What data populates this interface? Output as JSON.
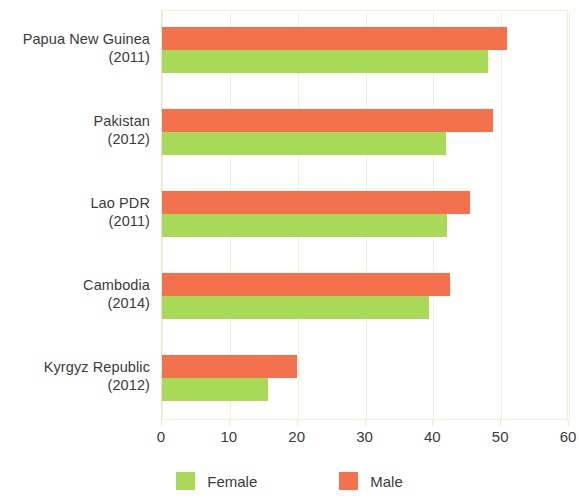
{
  "chart_data": {
    "type": "bar",
    "orientation": "horizontal",
    "title": "",
    "subtitle": "",
    "xlabel": "",
    "ylabel": "",
    "xlim": [
      0,
      60
    ],
    "xticks": [
      0,
      10,
      20,
      30,
      40,
      50,
      60
    ],
    "xtick_labels": [
      "0",
      "10",
      "20",
      "30",
      "40",
      "50",
      "60"
    ],
    "grid": true,
    "grid_axis": "x",
    "legend_position": "bottom",
    "categories": [
      "Papua New Guinea\n(2011)",
      "Pakistan\n(2012)",
      "Lao PDR\n(2011)",
      "Cambodia\n(2014)",
      "Kyrgyz Republic\n(2012)"
    ],
    "category_rows": [
      {
        "name": "Papua New Guinea",
        "year": "(2011)",
        "female": 48.0,
        "male": 50.8
      },
      {
        "name": "Pakistan",
        "year": "(2012)",
        "female": 41.8,
        "male": 48.8
      },
      {
        "name": "Lao PDR",
        "year": "(2011)",
        "female": 42.0,
        "male": 45.4
      },
      {
        "name": "Cambodia",
        "year": "(2014)",
        "female": 39.4,
        "male": 42.4
      },
      {
        "name": "Kyrgyz Republic",
        "year": "(2012)",
        "female": 15.6,
        "male": 19.9
      }
    ],
    "series": [
      {
        "name": "Female",
        "color": "#a8da58",
        "values": [
          48.0,
          41.8,
          42.0,
          39.4,
          15.6
        ]
      },
      {
        "name": "Male",
        "color": "#f4714e",
        "values": [
          50.8,
          48.8,
          45.4,
          42.4,
          19.9
        ]
      }
    ]
  },
  "legend": {
    "items": [
      {
        "label": "Female",
        "color": "#a8da58"
      },
      {
        "label": "Male",
        "color": "#f4714e"
      }
    ]
  },
  "colors": {
    "female": "#a8da58",
    "male": "#f4714e",
    "grid": "#f3f1d9",
    "text": "#3b3b3b",
    "background": "#ffffff"
  }
}
